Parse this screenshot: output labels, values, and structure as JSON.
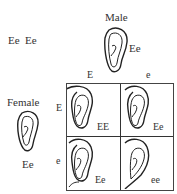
{
  "parents_genotypes": "Ee  Ee",
  "male": {
    "label": "Male",
    "genotype": "Ee",
    "alleles": [
      "E",
      "e"
    ]
  },
  "female": {
    "label": "Female",
    "genotype": "Ee",
    "alleles": [
      "E",
      "e"
    ]
  },
  "grid": {
    "cells": [
      {
        "genotype": "EE",
        "row": "E",
        "col": "E",
        "earlobe": "free"
      },
      {
        "genotype": "Ee",
        "row": "E",
        "col": "e",
        "earlobe": "free"
      },
      {
        "genotype": "Ee",
        "row": "e",
        "col": "E",
        "earlobe": "free"
      },
      {
        "genotype": "ee",
        "row": "e",
        "col": "e",
        "earlobe": "attached"
      }
    ]
  },
  "colors": {
    "line": "#222222",
    "text": "#333333",
    "background": "#ffffff"
  }
}
